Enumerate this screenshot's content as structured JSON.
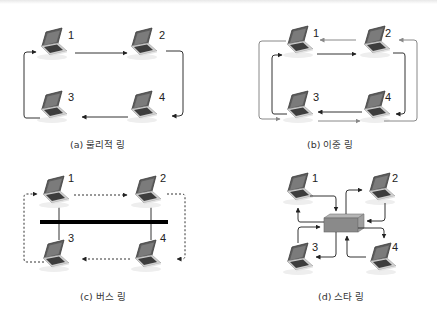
{
  "figure": {
    "panels": [
      {
        "id": "a",
        "caption": "(a) 물리적 링",
        "type": "physical-ring",
        "nodes": [
          "1",
          "2",
          "3",
          "4"
        ],
        "links": [
          {
            "from": "1",
            "to": "2",
            "style": "solid",
            "color": "#333333"
          },
          {
            "from": "2",
            "to": "4",
            "style": "solid",
            "color": "#333333"
          },
          {
            "from": "4",
            "to": "3",
            "style": "solid",
            "color": "#333333"
          },
          {
            "from": "3",
            "to": "1",
            "style": "solid",
            "color": "#333333"
          }
        ]
      },
      {
        "id": "b",
        "caption": "(b) 이중 링",
        "type": "dual-ring",
        "nodes": [
          "1",
          "2",
          "3",
          "4"
        ],
        "inner_ring": {
          "direction": "1→2→4→3→1",
          "color": "#333333"
        },
        "outer_ring": {
          "direction": "1←2←4←3←1",
          "color": "#888888"
        }
      },
      {
        "id": "c",
        "caption": "(c) 버스 링",
        "type": "bus-ring",
        "nodes": [
          "1",
          "2",
          "3",
          "4"
        ],
        "bus_color": "#000000",
        "logical_ring": {
          "direction": "1→2→4→3→1",
          "style": "dashed",
          "color": "#333333"
        }
      },
      {
        "id": "d",
        "caption": "(d) 스타 링",
        "type": "star-ring",
        "nodes": [
          "1",
          "2",
          "3",
          "4"
        ],
        "hub_color": "#8a8a8a",
        "links": "each node connects to central hub with in/out arrows"
      }
    ],
    "labels": {
      "a1": "1",
      "a2": "2",
      "a3": "3",
      "a4": "4",
      "b1": "1",
      "b2": "2",
      "b3": "3",
      "b4": "4",
      "c1": "1",
      "c2": "2",
      "c3": "3",
      "c4": "4",
      "d1": "1",
      "d2": "2",
      "d3": "3",
      "d4": "4"
    },
    "colors": {
      "line": "#333333",
      "outer_ring": "#888888",
      "laptop_screen": "#6e6e6e",
      "laptop_base": "#d9d9d9",
      "hub": "#8a8a8a"
    }
  }
}
